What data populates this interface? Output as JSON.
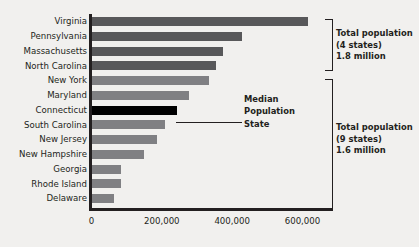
{
  "chart_data": {
    "type": "bar",
    "orientation": "horizontal",
    "title": "",
    "xlabel": "",
    "ylabel": "",
    "xlim": [
      0,
      660000
    ],
    "grid": false,
    "legend": "none",
    "categories": [
      "Virginia",
      "Pennsylvania",
      "Massachusetts",
      "North Carolina",
      "New York",
      "Maryland",
      "Connecticut",
      "South Carolina",
      "New Jersey",
      "New Hampshire",
      "Georgia",
      "Rhode Island",
      "Delaware"
    ],
    "values": [
      617000,
      427000,
      375000,
      353000,
      333000,
      276000,
      242000,
      208000,
      185000,
      148000,
      83000,
      83000,
      64000
    ],
    "bar_colors": [
      "#58585a",
      "#58585a",
      "#58585a",
      "#58585a",
      "#808083",
      "#808083",
      "#000000",
      "#808083",
      "#808083",
      "#808083",
      "#808083",
      "#808083",
      "#808083"
    ],
    "ticks": [
      {
        "label": "0",
        "value": 0
      },
      {
        "label": "200,000",
        "value": 200000
      },
      {
        "label": "400,000",
        "value": 400000
      },
      {
        "label": "600,000",
        "value": 600000
      }
    ],
    "annotations": [
      {
        "name": "top-group",
        "lines": [
          "Total population",
          "(4 states)",
          "1.8 million"
        ],
        "covers_categories": [
          "Virginia",
          "Pennsylvania",
          "Massachusetts",
          "North Carolina"
        ]
      },
      {
        "name": "bottom-group",
        "lines": [
          "Total population",
          "(9 states)",
          "1.6 million"
        ],
        "covers_categories": [
          "New York",
          "Maryland",
          "Connecticut",
          "South Carolina",
          "New Jersey",
          "New Hampshire",
          "Georgia",
          "Rhode Island",
          "Delaware"
        ]
      },
      {
        "name": "median-callout",
        "lines": [
          "Median",
          "Population",
          "State"
        ],
        "points_at": "Connecticut"
      }
    ]
  },
  "colors": {
    "background": "#f1f0ee",
    "axis": "#231f20",
    "text": "#231f20",
    "bar_dark": "#58585a",
    "bar_light": "#808083",
    "bar_highlight": "#000000"
  }
}
